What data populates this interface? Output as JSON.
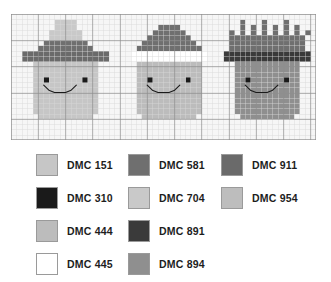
{
  "chart": {
    "grid": {
      "columns": 56,
      "rows": 24,
      "cell_px": 5.4,
      "minor_line_color": "#d8d8d8",
      "major_line_color": "#8e8e8e",
      "major_every": 5,
      "background": "#f6f6f6"
    },
    "palette": {
      "DMC 151": "#c6c6c6",
      "DMC 310": "#1a1a1a",
      "DMC 444": "#bcbcbc",
      "DMC 445": "#ffffff",
      "DMC 581": "#6f6f6f",
      "DMC 704": "#c9c9c9",
      "DMC 891": "#3a3a3a",
      "DMC 894": "#8f8f8f",
      "DMC 911": "#6a6a6a",
      "DMC 954": "#bdbdbd"
    },
    "figures": [
      {
        "name": "witch-hat-character",
        "col_offset": 2,
        "row_offset": 1,
        "pixels": [
          "......HHHH......",
          "......HHHH......",
          ".....HHHHHH.....",
          ".....HHHHHH.....",
          "....GGGGGGGG....",
          "...GGGGGGGGGG...",
          "BBBBBBBBBBBBBBBB",
          "BBBBBBBBBBBBBBBB",
          "..FFFFFFFFFFFF..",
          "..FFFFFFFFFFFF..",
          "..FFFFFFFFFFFF..",
          "..FFKFFFFFFKFF..",
          "..FFFFFFFFFFFF..",
          "..FFFFFFFFFFFF..",
          "..FFFFFFFFFFFF..",
          "..FFFFFFFFFFFF..",
          "..FFFFFFFFFFFF..",
          "..FFFFFFFFFFFF..",
          "...FFFFFFFFFF...",
          "................"
        ]
      },
      {
        "name": "santa-hat-character",
        "col_offset": 21,
        "row_offset": 1,
        "pixels": [
          "................",
          "......GGGG......",
          ".....GGGGGG.....",
          "....GGGGGGGG....",
          "...GGGGGGGGGG...",
          "..GGGGGGGGGGGG..",
          ".WWWWWWWWWWWWWW.",
          ".WWWWWWWWWWWWWW.",
          "..AAAAAAAAAAAA..",
          "..AAAAAAAAAAAA..",
          "..AAAAAAAAAAAA..",
          "..AAKAAAAAAKAA..",
          "..AAAAAAAAAAAA..",
          "..AAAAAAAAAAAA..",
          "..AAAAAAAAAAAA..",
          "..AAAAAAAAAAAA..",
          "..AAAAAAAAAAAA..",
          "..AAAAAAAAAAAA..",
          "...AAAAAAAAAA...",
          "................"
        ]
      },
      {
        "name": "crown-king-character",
        "col_offset": 39,
        "row_offset": 1,
        "pixels": [
          "...G...G...G....",
          "...G.G.G.G.G.G..",
          ".G.G.G.G.G.G.G.G",
          ".GGGGGGGGGGGGGG.",
          ".GGGGGGGGGGGGGG.",
          ".GGGGGGGGGGGGGG.",
          "DDDDDDDDDDDDDDDD",
          "DDDDDDDDDDDDDDDD",
          "..CCCCCCCCCCCC..",
          "..CCCCCCCCCCCC..",
          "..CCCCCCCCCCCC..",
          "..CCKCCCCCCKCC..",
          "..CCCCCCCCCCCC..",
          "..CCCCCCCCCCCC..",
          "..CCCCCCCCCCCC..",
          "..CCCCCCCCCCCC..",
          "..CCCCCCCCCCCC..",
          "..CCCCCCCCCCCC..",
          "...CCCCCCCCCC...",
          "................"
        ]
      }
    ],
    "pixel_key": {
      "H": "DMC 704",
      "G": "DMC 581",
      "B": "DMC 911",
      "F": "DMC 151",
      "A": "DMC 444",
      "C": "DMC 894",
      "D": "DMC 891",
      "W": "DMC 445",
      "K": "DMC 310",
      ".": "empty"
    },
    "backstitch": {
      "color": "DMC 310",
      "description": "smile curve below eyes on each face"
    }
  },
  "legend": {
    "columns": [
      {
        "items": [
          {
            "code": "DMC 151",
            "color": "#c6c6c6"
          },
          {
            "code": "DMC 310",
            "color": "#1a1a1a"
          },
          {
            "code": "DMC 444",
            "color": "#bcbcbc"
          },
          {
            "code": "DMC 445",
            "color": "#ffffff"
          }
        ]
      },
      {
        "items": [
          {
            "code": "DMC 581",
            "color": "#6f6f6f"
          },
          {
            "code": "DMC 704",
            "color": "#c9c9c9"
          },
          {
            "code": "DMC 891",
            "color": "#3a3a3a"
          },
          {
            "code": "DMC 894",
            "color": "#8f8f8f"
          }
        ]
      },
      {
        "items": [
          {
            "code": "DMC 911",
            "color": "#6a6a6a"
          },
          {
            "code": "DMC 954",
            "color": "#bdbdbd"
          }
        ]
      }
    ]
  }
}
